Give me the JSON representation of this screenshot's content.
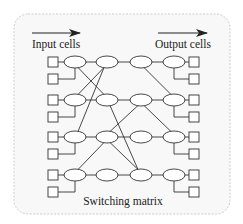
{
  "diagram": {
    "title": "Switching matrix",
    "input_label": "Input cells",
    "output_label": "Output cells",
    "colors": {
      "stroke": "#333333",
      "frame_border": "#cccccc",
      "frame_fill": "#f8f8f8",
      "text": "#222222"
    },
    "rows": 4,
    "columns": 4,
    "cells_per_row_each_side": 2,
    "row_y": [
      62,
      100,
      137,
      175
    ],
    "column_x": [
      75,
      107,
      141,
      174
    ],
    "cross_links": [
      {
        "from": [
          1,
          1
        ],
        "to": [
          2,
          2
        ]
      },
      {
        "from": [
          2,
          1
        ],
        "to": [
          1,
          2
        ]
      },
      {
        "from": [
          2,
          1
        ],
        "to": [
          1,
          3
        ]
      },
      {
        "from": [
          2,
          2
        ],
        "to": [
          3,
          4
        ]
      },
      {
        "from": [
          3,
          2
        ],
        "to": [
          2,
          3
        ]
      },
      {
        "from": [
          2,
          3
        ],
        "to": [
          1,
          4
        ]
      },
      {
        "from": [
          2,
          3
        ],
        "to": [
          3,
          4
        ]
      },
      {
        "from": [
          3,
          1
        ],
        "to": [
          4,
          2
        ]
      },
      {
        "from": [
          3,
          2
        ],
        "to": [
          4,
          3
        ]
      }
    ]
  }
}
